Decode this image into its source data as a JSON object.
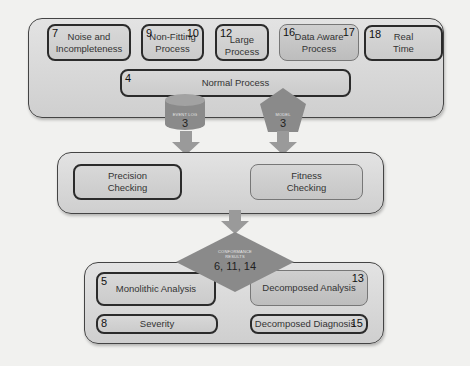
{
  "diagram": {
    "top_group": {
      "boxes": [
        {
          "id": "noise",
          "label": "Noise and\nIncompleteness",
          "left_num": "7",
          "right_num": ""
        },
        {
          "id": "non-fitting",
          "label": "Non-Fitting\nProcess",
          "left_num": "9",
          "right_num": "10"
        },
        {
          "id": "large",
          "label": "Large\nProcess",
          "left_num": "12",
          "right_num": ""
        },
        {
          "id": "data-aware",
          "label": "Data Aware\nProcess",
          "left_num": "16",
          "right_num": "17"
        },
        {
          "id": "real-time",
          "label": "Real\nTime",
          "left_num": "18",
          "right_num": ""
        }
      ],
      "normal_process": {
        "label": "Normal Process",
        "left_num": "4"
      }
    },
    "inputs": {
      "event_log": {
        "label": "EVENT LOG",
        "num": "3"
      },
      "model": {
        "label": "MODEL",
        "num": "3"
      }
    },
    "checking_group": {
      "precision": {
        "label": "Precision\nChecking"
      },
      "fitness": {
        "label": "Fitness\nChecking"
      }
    },
    "results": {
      "label": "CONFORMANCE\nRESULTS",
      "nums": "6, 11, 14"
    },
    "analysis_group": {
      "monolithic": {
        "label": "Monolithic  Analysis",
        "num": "5"
      },
      "decomposed_analysis": {
        "label": "Decomposed Analysis",
        "num": "13"
      },
      "severity": {
        "label": "Severity",
        "num": "8"
      },
      "decomposed_diagnosis": {
        "label": "Decomposed Diagnosis",
        "num": "15"
      }
    },
    "colors": {
      "shape_fill": "#8a8a8a",
      "arrow_fill": "#9a9a9a",
      "border": "#2b2b2b",
      "background": "#f1f1ef"
    }
  }
}
